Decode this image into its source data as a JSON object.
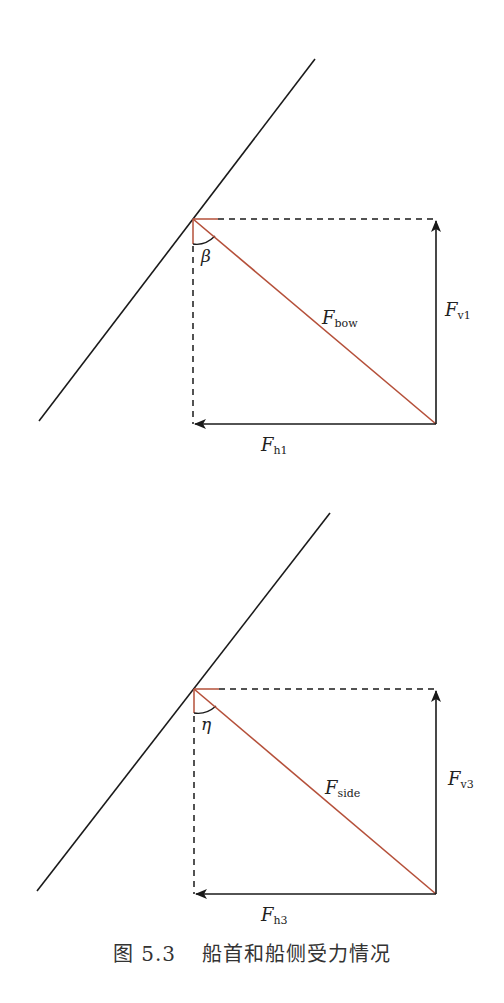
{
  "colors": {
    "line": "#1a1a1a",
    "force": "#b5503a",
    "dashed": "#1a1a1a"
  },
  "diagrams": [
    {
      "angle_label": "β",
      "force_label": "F",
      "force_sub": "bow",
      "vertical_label": "F",
      "vertical_sub": "v1",
      "horizontal_label": "F",
      "horizontal_sub": "h1"
    },
    {
      "angle_label": "η",
      "force_label": "F",
      "force_sub": "side",
      "vertical_label": "F",
      "vertical_sub": "v3",
      "horizontal_label": "F",
      "horizontal_sub": "h3"
    }
  ],
  "caption": {
    "number": "图 5.3",
    "text": "船首和船侧受力情况"
  }
}
